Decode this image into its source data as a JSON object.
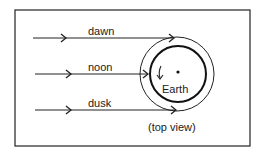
{
  "diagram": {
    "rays": [
      {
        "label": "dawn",
        "y": 38
      },
      {
        "label": "noon",
        "y": 74
      },
      {
        "label": "dusk",
        "y": 110
      }
    ],
    "earth_label": "Earth",
    "caption": "(top view)",
    "colors": {
      "line": "#1a1a1a",
      "background": "#ffffff"
    }
  }
}
